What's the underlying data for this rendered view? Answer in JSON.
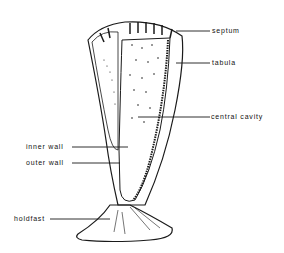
{
  "diagram": {
    "labels": [
      {
        "id": "septum",
        "text": "septum"
      },
      {
        "id": "tabula",
        "text": "tabula"
      },
      {
        "id": "central-cavity",
        "text": "central cavity"
      },
      {
        "id": "inner-wall",
        "text": "inner wall"
      },
      {
        "id": "outer-wall",
        "text": "outer wall"
      },
      {
        "id": "holdfast",
        "text": "holdfast"
      }
    ],
    "colors": {
      "line": "#1a1a1a",
      "background": "#ffffff"
    }
  }
}
